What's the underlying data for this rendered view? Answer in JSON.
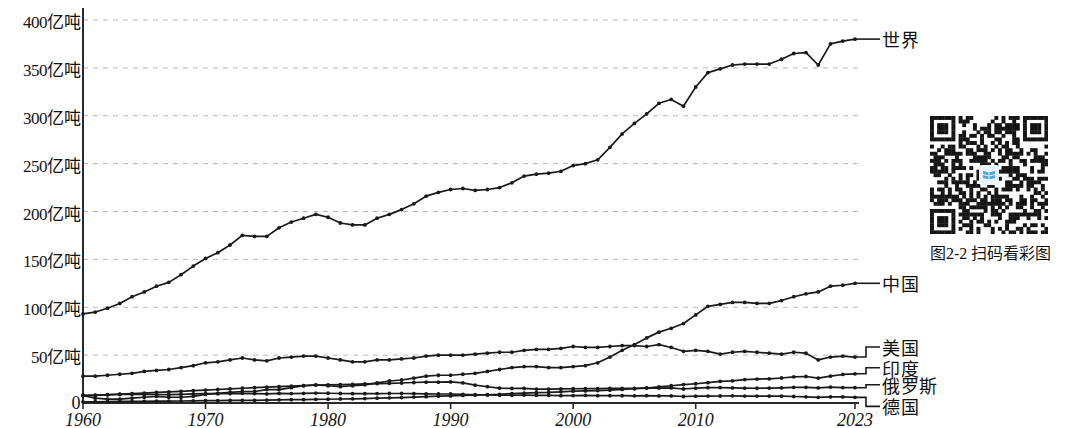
{
  "figure": {
    "caption": "图2-2 扫码看彩图",
    "qr_logo_name": "book-logo"
  },
  "chart_data": {
    "type": "line",
    "title": "",
    "xlabel": "",
    "ylabel": "",
    "unit": "亿吨",
    "xlim": [
      1960,
      2023
    ],
    "ylim": [
      0,
      410
    ],
    "grid": true,
    "grid_axis": "y",
    "legend_position": "right-inline-labels",
    "y_ticks": [
      0,
      50,
      100,
      150,
      200,
      250,
      300,
      350,
      400
    ],
    "y_tick_labels": [
      "0",
      "50亿吨",
      "100亿吨",
      "150亿吨",
      "200亿吨",
      "250亿吨",
      "300亿吨",
      "350亿吨",
      "400亿吨"
    ],
    "x_ticks": [
      1960,
      1970,
      1980,
      1990,
      2000,
      2010,
      2023
    ],
    "x_tick_labels": [
      "1960",
      "1970",
      "1980",
      "1990",
      "2000",
      "2010",
      "2023"
    ],
    "x": [
      1960,
      1961,
      1962,
      1963,
      1964,
      1965,
      1966,
      1967,
      1968,
      1969,
      1970,
      1971,
      1972,
      1973,
      1974,
      1975,
      1976,
      1977,
      1978,
      1979,
      1980,
      1981,
      1982,
      1983,
      1984,
      1985,
      1986,
      1987,
      1988,
      1989,
      1990,
      1991,
      1992,
      1993,
      1994,
      1995,
      1996,
      1997,
      1998,
      1999,
      2000,
      2001,
      2002,
      2003,
      2004,
      2005,
      2006,
      2007,
      2008,
      2009,
      2010,
      2011,
      2012,
      2013,
      2014,
      2015,
      2016,
      2017,
      2018,
      2019,
      2020,
      2021,
      2022,
      2023
    ],
    "series": [
      {
        "name": "世界",
        "marker": "dot",
        "color": "#1a1a1a",
        "values": [
          93,
          95,
          99,
          104,
          111,
          116,
          122,
          126,
          134,
          143,
          151,
          157,
          165,
          175,
          174,
          174,
          183,
          189,
          193,
          197,
          194,
          188,
          186,
          186,
          193,
          197,
          202,
          208,
          216,
          220,
          223,
          224,
          222,
          223,
          225,
          230,
          237,
          239,
          240,
          242,
          248,
          250,
          254,
          267,
          281,
          292,
          302,
          313,
          317,
          310,
          330,
          345,
          349,
          353,
          354,
          354,
          354,
          359,
          365,
          366,
          353,
          375,
          378,
          380
        ]
      },
      {
        "name": "中国",
        "marker": "dot",
        "color": "#1a1a1a",
        "values": [
          8,
          5,
          4,
          4,
          5,
          6,
          7,
          6,
          6,
          7,
          9,
          10,
          11,
          12,
          12,
          14,
          14,
          16,
          18,
          19,
          18,
          17,
          18,
          19,
          21,
          23,
          24,
          26,
          28,
          29,
          29,
          30,
          31,
          33,
          35,
          37,
          38,
          38,
          37,
          37,
          38,
          39,
          42,
          48,
          55,
          61,
          68,
          74,
          78,
          83,
          92,
          101,
          103,
          105,
          105,
          104,
          104,
          107,
          111,
          114,
          116,
          122,
          123,
          125
        ]
      },
      {
        "name": "美国",
        "marker": "dot",
        "color": "#1a1a1a",
        "values": [
          28,
          28,
          29,
          30,
          31,
          33,
          34,
          35,
          37,
          39,
          42,
          43,
          45,
          47,
          45,
          44,
          47,
          48,
          49,
          49,
          47,
          45,
          43,
          43,
          45,
          45,
          46,
          47,
          49,
          50,
          50,
          50,
          51,
          52,
          53,
          53,
          55,
          56,
          56,
          57,
          59,
          58,
          58,
          59,
          60,
          60,
          59,
          61,
          58,
          54,
          55,
          54,
          51,
          53,
          54,
          53,
          52,
          51,
          53,
          52,
          45,
          48,
          49,
          48
        ]
      },
      {
        "name": "印度",
        "marker": "dot",
        "color": "#1a1a1a",
        "values": [
          1.2,
          1.3,
          1.5,
          1.6,
          1.7,
          1.8,
          1.9,
          2.0,
          2.1,
          2.2,
          2.4,
          2.5,
          2.7,
          2.7,
          2.8,
          3.1,
          3.3,
          3.5,
          3.5,
          3.8,
          3.9,
          4.2,
          4.4,
          4.6,
          5.0,
          5.4,
          5.7,
          6.2,
          6.6,
          7.1,
          7.4,
          7.9,
          8.3,
          8.6,
          9.1,
          9.8,
          10.3,
          10.8,
          11.1,
          11.7,
          12.3,
          12.6,
          13.0,
          13.4,
          14.2,
          14.9,
          15.6,
          16.9,
          18.0,
          19.2,
          20.1,
          21.2,
          22.6,
          23.2,
          24.5,
          25.0,
          25.3,
          26.1,
          27.3,
          27.7,
          26.0,
          28.0,
          29.8,
          30.5
        ]
      },
      {
        "name": "俄罗斯",
        "marker": "dot",
        "color": "#1a1a1a",
        "values": [
          7.5,
          8.0,
          8.7,
          9.3,
          9.8,
          10.4,
          11.0,
          11.6,
          12.2,
          12.9,
          13.5,
          14.1,
          14.8,
          15.4,
          16.0,
          16.6,
          17.2,
          17.7,
          18.2,
          18.7,
          19.0,
          19.2,
          19.5,
          19.9,
          20.3,
          20.6,
          20.9,
          21.4,
          21.7,
          21.8,
          22.0,
          21.0,
          18.6,
          17.0,
          15.5,
          15.2,
          15.2,
          14.5,
          14.4,
          14.7,
          14.9,
          15.0,
          15.0,
          15.3,
          15.3,
          15.3,
          15.7,
          15.6,
          15.7,
          14.6,
          15.5,
          16.0,
          16.1,
          15.7,
          15.5,
          15.4,
          15.6,
          15.9,
          16.4,
          16.4,
          15.7,
          16.6,
          16.1,
          16.0
        ]
      },
      {
        "name": "德国",
        "marker": "dot",
        "color": "#1a1a1a",
        "values": [
          8.1,
          8.2,
          8.5,
          8.9,
          9.1,
          9.0,
          8.9,
          8.7,
          9.1,
          9.5,
          9.8,
          9.7,
          9.8,
          10.1,
          9.8,
          9.5,
          10.0,
          9.8,
          10.1,
          10.4,
          10.2,
          9.9,
          9.7,
          9.7,
          9.8,
          9.9,
          9.9,
          9.8,
          9.6,
          9.4,
          9.4,
          9.0,
          8.6,
          8.4,
          8.2,
          8.1,
          8.3,
          8.0,
          8.0,
          7.7,
          7.8,
          7.9,
          7.7,
          7.7,
          7.6,
          7.5,
          7.6,
          7.4,
          7.4,
          6.8,
          7.1,
          7.2,
          7.3,
          7.5,
          7.2,
          7.2,
          7.2,
          7.1,
          6.8,
          6.4,
          5.9,
          6.3,
          6.3,
          5.9
        ]
      }
    ],
    "annotations": [
      {
        "text": "世界",
        "anchor_year": 2023,
        "anchor_value": 380
      },
      {
        "text": "中国",
        "anchor_year": 2023,
        "anchor_value": 125
      },
      {
        "text": "美国",
        "anchor_year": 2023,
        "anchor_value": 48
      },
      {
        "text": "印度",
        "anchor_year": 2023,
        "anchor_value": 30.5
      },
      {
        "text": "俄罗斯",
        "anchor_year": 2023,
        "anchor_value": 16
      },
      {
        "text": "德国",
        "anchor_year": 2023,
        "anchor_value": 5.9
      }
    ]
  }
}
